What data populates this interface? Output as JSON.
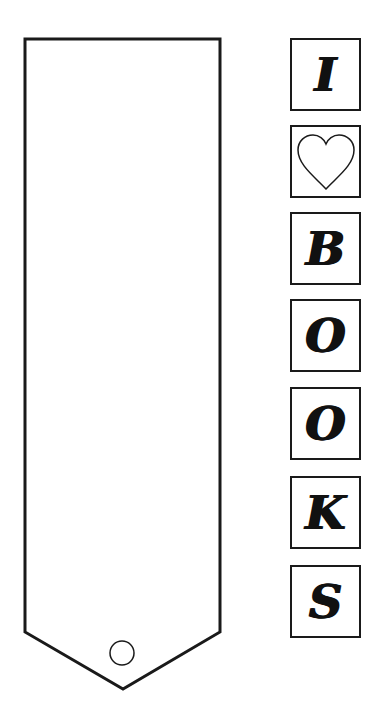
{
  "bookmark": {
    "stroke_color": "#1a1a1a",
    "fill_color": "#ffffff",
    "hole": "circle"
  },
  "tiles": [
    {
      "type": "letter",
      "value": "I"
    },
    {
      "type": "icon",
      "value": "heart-outline"
    },
    {
      "type": "letter",
      "value": "B"
    },
    {
      "type": "letter",
      "value": "O"
    },
    {
      "type": "letter",
      "value": "O"
    },
    {
      "type": "letter",
      "value": "K"
    },
    {
      "type": "letter",
      "value": "S"
    }
  ]
}
